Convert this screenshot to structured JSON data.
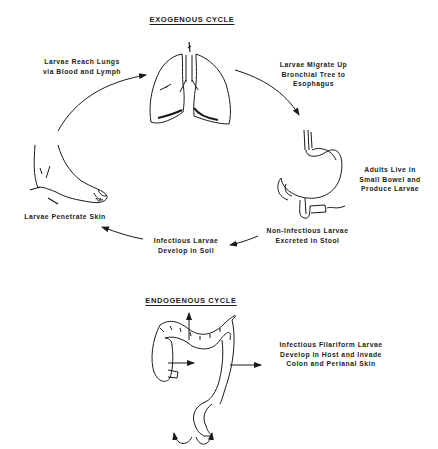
{
  "exogenous": {
    "title": "EXOGENOUS CYCLE",
    "steps": [
      {
        "id": "lungs",
        "label": "Larvae Reach Lungs\nvia Blood and Lymph",
        "icon": "lungs-icon"
      },
      {
        "id": "esophagus",
        "label": "Larvae Migrate Up\nBronchial Tree to\nEsophagus",
        "icon": "arrow-icon"
      },
      {
        "id": "small-bowel",
        "label": "Adults Live in\nSmall Bowel and\nProduce Larvae",
        "icon": "stomach-intestine-icon"
      },
      {
        "id": "stool",
        "label": "Non-Infectious Larvae\nExcreted in Stool",
        "icon": "arrow-icon"
      },
      {
        "id": "soil",
        "label": "Infectious Larvae\nDevelop in Soil",
        "icon": "arrow-icon"
      },
      {
        "id": "skin",
        "label": "Larvae Penetrate Skin",
        "icon": "foot-icon"
      }
    ]
  },
  "endogenous": {
    "title": "ENDOGENOUS CYCLE",
    "label": "Infectious Filariform Larvae\nDevelop in Host and Invade\nColon and Perianal Skin",
    "icon": "colon-icon"
  },
  "colors": {
    "ink": "#1a1a1a",
    "background": "#ffffff"
  }
}
